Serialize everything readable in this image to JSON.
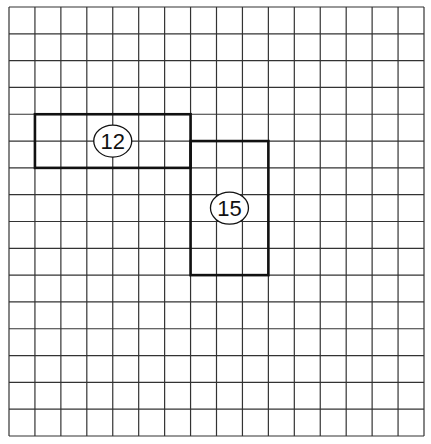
{
  "grid": {
    "left": 9,
    "top": 7,
    "right": 424,
    "bottom": 436,
    "columns": 16,
    "rows": 16,
    "line_color": "#333333",
    "line_width": 1.2
  },
  "shapes": [
    {
      "id": "rect-12",
      "label": "12",
      "col": 1,
      "row": 4,
      "cols": 6,
      "rows": 2,
      "stroke": "#111111"
    },
    {
      "id": "rect-15",
      "label": "15",
      "col": 7,
      "row": 5,
      "cols": 3,
      "rows": 5,
      "stroke": "#111111"
    }
  ]
}
